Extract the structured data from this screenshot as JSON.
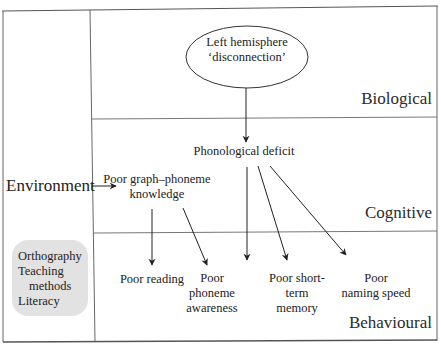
{
  "diagram": {
    "type": "causal-model",
    "levels": [
      {
        "id": "biological",
        "label": "Biological"
      },
      {
        "id": "cognitive",
        "label": "Cognitive"
      },
      {
        "id": "behavioural",
        "label": "Behavioural"
      }
    ],
    "environment": {
      "label": "Environment",
      "factors": [
        "Orthography",
        "Teaching",
        "methods",
        "Literacy"
      ]
    },
    "nodes": {
      "biological_cause": {
        "line1": "Left hemisphere",
        "line2": "‘disconnection’"
      },
      "phonological_deficit": {
        "label": "Phonological deficit"
      },
      "graph_phoneme": {
        "line1": "Poor graph–phoneme",
        "line2": "knowledge"
      },
      "poor_reading": {
        "label": "Poor reading"
      },
      "phoneme_awareness": {
        "line1": "Poor",
        "line2": "phoneme",
        "line3": "awareness"
      },
      "short_term_memory": {
        "line1": "Poor short-",
        "line2": "term",
        "line3": "memory"
      },
      "naming_speed": {
        "line1": "Poor",
        "line2": "naming speed"
      }
    },
    "edges": [
      {
        "from": "Left hemisphere ‘disconnection’",
        "to": "Phonological deficit"
      },
      {
        "from": "Environment",
        "to": "Poor graph–phoneme knowledge"
      },
      {
        "from": "Poor graph–phoneme knowledge",
        "to": "Poor reading"
      },
      {
        "from": "Poor graph–phoneme knowledge",
        "to": "Poor phoneme awareness"
      },
      {
        "from": "Phonological deficit",
        "to": "Poor phoneme awareness"
      },
      {
        "from": "Phonological deficit",
        "to": "Poor short-term memory"
      },
      {
        "from": "Phonological deficit",
        "to": "Poor naming speed"
      }
    ],
    "colors": {
      "line": "#333333",
      "frame": "#555555",
      "factor_box": "#e2e2e2"
    }
  }
}
